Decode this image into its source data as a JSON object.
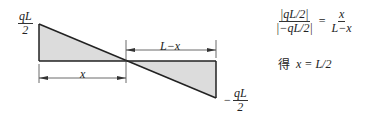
{
  "diagram": {
    "top_label": {
      "num": "qL",
      "den": "2"
    },
    "bottom_label": {
      "sign": "−",
      "num": "qL",
      "den": "2"
    },
    "dim_x": "x",
    "dim_lx": "L−x"
  },
  "equations": {
    "ratio_left_num": "|qL/2|",
    "ratio_left_den": "|−qL/2|",
    "equals": "=",
    "ratio_right_num": "x",
    "ratio_right_den": "L−x",
    "result_prefix": "得",
    "result": "x = L/2"
  },
  "colors": {
    "fill": "#d9d9d9",
    "line": "#222222"
  }
}
